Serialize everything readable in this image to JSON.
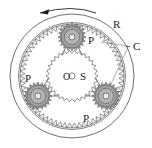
{
  "figure": {
    "background_color": "#ffffff",
    "line_color": "#3a3a3a",
    "gear_fill": "#a8a8a8",
    "sun_fill": "#ffffff",
    "labels": {
      "ring": "R",
      "carrier": "C",
      "sun": "S",
      "sun_center": "O",
      "planet": "P"
    }
  },
  "components": {
    "ring_gear": {
      "label": "R",
      "name": "ring-gear",
      "center": [
        72,
        76
      ],
      "outer_radius": 62,
      "tooth_root_radius": 52,
      "tooth_tip_radius": 47,
      "teeth": 64
    },
    "sun_gear": {
      "label": "S",
      "center_mark": "O",
      "name": "sun-gear",
      "center": [
        72,
        76
      ],
      "radius": 26,
      "teeth": 30
    },
    "planets": [
      {
        "label": "P",
        "name": "planet-gear-top",
        "center": [
          72,
          37
        ],
        "radius": 14,
        "teeth": 20,
        "label_position": [
          89,
          41
        ]
      },
      {
        "label": "P",
        "name": "planet-gear-left",
        "center": [
          38,
          96
        ],
        "radius": 14,
        "teeth": 20,
        "label_position": [
          28,
          80
        ]
      },
      {
        "label": "P",
        "name": "planet-gear-right",
        "center": [
          106,
          96
        ],
        "radius": 14,
        "teeth": 20,
        "label_position": [
          86,
          118
        ]
      }
    ],
    "carrier": {
      "label": "C",
      "name": "carrier",
      "label_position": [
        135,
        47
      ],
      "vertices": [
        [
          72,
          37
        ],
        [
          38,
          96
        ],
        [
          106,
          96
        ]
      ]
    },
    "rotation_arrow": {
      "name": "rotation-arrow",
      "direction": "counterclockwise",
      "description": "curved arrow above ring gear pointing left"
    }
  }
}
